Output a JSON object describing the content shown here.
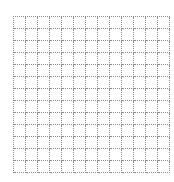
{
  "grid": {
    "rows": 13,
    "cols": 13,
    "cell_size_px": 12,
    "line_style": "dotted",
    "line_color": "#8c8c8c",
    "background": "#ffffff"
  }
}
